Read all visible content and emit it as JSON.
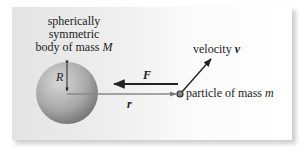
{
  "figure": {
    "body_label_lines": [
      "spherically",
      "symmetric",
      "body of mass"
    ],
    "body_mass_symbol": "M",
    "radius_symbol": "R",
    "force_symbol": "F",
    "distance_symbol": "r",
    "velocity_label": "velocity",
    "velocity_symbol": "v",
    "particle_label": "particle of mass",
    "particle_mass_symbol": "m"
  },
  "colors": {
    "panel_left": "#e4e4e4",
    "panel_right": "#ffffff",
    "sphere_light": "#d4d4d4",
    "sphere_dark": "#7d7d7d",
    "arrow": "#222222",
    "r_line": "#8a8a8a"
  }
}
